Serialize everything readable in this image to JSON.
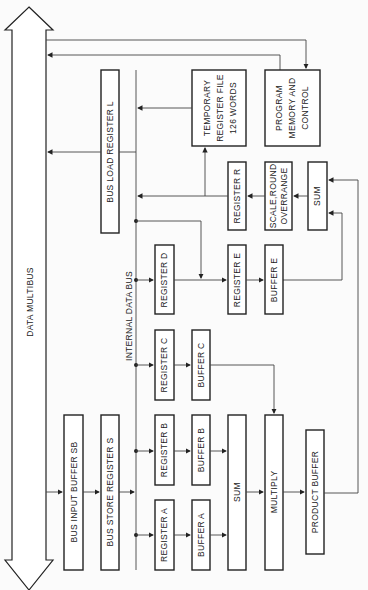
{
  "diagram": {
    "orientation": "rotated-90-ccw",
    "bus": {
      "label": "DATA MULTIBUS"
    },
    "internal_bus": {
      "label": "INTERNAL DATA BUS"
    },
    "blocks": {
      "bus_input_buffer": "BUS INPUT BUFFER SB",
      "bus_store_register": "BUS STORE REGISTER S",
      "bus_load_register": "BUS LOAD REGISTER L",
      "register_a": "REGISTER A",
      "register_b": "REGISTER B",
      "register_c": "REGISTER C",
      "register_d": "REGISTER D",
      "register_e": "REGISTER E",
      "register_r": "REGISTER R",
      "buffer_a": "BUFFER A",
      "buffer_b": "BUFFER B",
      "buffer_c": "BUFFER C",
      "buffer_e": "BUFFER E",
      "sum_left": "SUM",
      "sum_right": "SUM",
      "multiply": "MULTIPLY",
      "product_buffer": "PRODUCT BUFFER",
      "scale_round_1": "SCALE,ROUND",
      "scale_round_2": "OVERRANGE",
      "temp_reg_1": "TEMPORARY",
      "temp_reg_2": "REGISTER FILE",
      "temp_reg_3": "126 WORDS",
      "prog_mem_1": "PROGRAM",
      "prog_mem_2": "MEMORY AND",
      "prog_mem_3": "CONTROL"
    }
  }
}
